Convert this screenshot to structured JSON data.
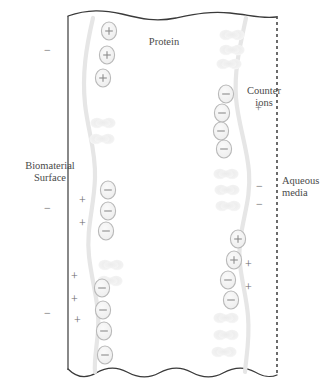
{
  "figure": {
    "labels": {
      "biomaterial_line1": "Biomaterial",
      "biomaterial_line2": "Surface",
      "protein": "Protein",
      "counter_line1": "Counter",
      "counter_line2": "ions",
      "aqueous_line1": "Aqueous",
      "aqueous_line2": "media"
    },
    "colors": {
      "boundary_stroke": "#3a3a3a",
      "chain_stroke": "#e3e3e3",
      "ion_fill": "#f0f0f0",
      "ion_stroke": "#b9b9b9",
      "ion_symbol": "#8c8c8c",
      "protein_fill": "#f1f1f1",
      "text": "#4a4a4a",
      "free_sign": "#6a6a6a"
    },
    "boundaries": {
      "top_edge": "wavy-line",
      "bottom_edge": "wavy-line",
      "left_edge": "solid-vertical-line",
      "right_edge": "dashed-vertical-line"
    },
    "ions": [
      {
        "chain": "left",
        "charge": "+",
        "x": 109,
        "y": 31
      },
      {
        "chain": "left",
        "charge": "+",
        "x": 107,
        "y": 55
      },
      {
        "chain": "left",
        "charge": "+",
        "x": 103,
        "y": 78
      },
      {
        "chain": "left",
        "charge": "-",
        "x": 108,
        "y": 190
      },
      {
        "chain": "left",
        "charge": "-",
        "x": 108,
        "y": 211
      },
      {
        "chain": "left",
        "charge": "-",
        "x": 106,
        "y": 231
      },
      {
        "chain": "left",
        "charge": "-",
        "x": 102,
        "y": 288
      },
      {
        "chain": "left",
        "charge": "-",
        "x": 103,
        "y": 310
      },
      {
        "chain": "left",
        "charge": "-",
        "x": 104,
        "y": 331
      },
      {
        "chain": "left",
        "charge": "-",
        "x": 105,
        "y": 355
      },
      {
        "chain": "right",
        "charge": "-",
        "x": 226,
        "y": 94
      },
      {
        "chain": "right",
        "charge": "-",
        "x": 222,
        "y": 113
      },
      {
        "chain": "right",
        "charge": "-",
        "x": 221,
        "y": 131
      },
      {
        "chain": "right",
        "charge": "-",
        "x": 224,
        "y": 149
      },
      {
        "chain": "right",
        "charge": "+",
        "x": 238,
        "y": 239
      },
      {
        "chain": "right",
        "charge": "+",
        "x": 234,
        "y": 260
      },
      {
        "chain": "right",
        "charge": "-",
        "x": 228,
        "y": 280
      },
      {
        "chain": "right",
        "charge": "-",
        "x": 231,
        "y": 300
      }
    ],
    "proteins": [
      {
        "chain": "left",
        "x": 103,
        "y": 123
      },
      {
        "chain": "left",
        "x": 102,
        "y": 139
      },
      {
        "chain": "left",
        "x": 111,
        "y": 265
      },
      {
        "chain": "left",
        "x": 110,
        "y": 281
      },
      {
        "chain": "right",
        "x": 232,
        "y": 35
      },
      {
        "chain": "right",
        "x": 232,
        "y": 50
      },
      {
        "chain": "right",
        "x": 229,
        "y": 64
      },
      {
        "chain": "right",
        "x": 226,
        "y": 174
      },
      {
        "chain": "right",
        "x": 227,
        "y": 190
      },
      {
        "chain": "right",
        "x": 228,
        "y": 206
      },
      {
        "chain": "right",
        "x": 226,
        "y": 318
      },
      {
        "chain": "right",
        "x": 226,
        "y": 335
      },
      {
        "chain": "right",
        "x": 224,
        "y": 352
      }
    ],
    "free_signs": [
      {
        "symbol": "-",
        "x": 48,
        "y": 50,
        "side": "left-outside"
      },
      {
        "symbol": "-",
        "x": 48,
        "y": 208,
        "side": "left-outside"
      },
      {
        "symbol": "-",
        "x": 48,
        "y": 313,
        "side": "left-outside"
      },
      {
        "symbol": "+",
        "x": 83,
        "y": 200,
        "side": "left-inside"
      },
      {
        "symbol": "+",
        "x": 83,
        "y": 223,
        "side": "left-inside"
      },
      {
        "symbol": "+",
        "x": 75,
        "y": 276,
        "side": "left-inside"
      },
      {
        "symbol": "+",
        "x": 75,
        "y": 299,
        "side": "left-inside"
      },
      {
        "symbol": "+",
        "x": 78,
        "y": 320,
        "side": "left-inside"
      },
      {
        "symbol": "+",
        "x": 259,
        "y": 108,
        "side": "right-inside"
      },
      {
        "symbol": "-",
        "x": 260,
        "y": 186,
        "side": "right-inside"
      },
      {
        "symbol": "-",
        "x": 260,
        "y": 204,
        "side": "right-inside"
      },
      {
        "symbol": "+",
        "x": 249,
        "y": 264,
        "side": "right-inside"
      },
      {
        "symbol": "+",
        "x": 249,
        "y": 287,
        "side": "right-inside"
      }
    ]
  }
}
